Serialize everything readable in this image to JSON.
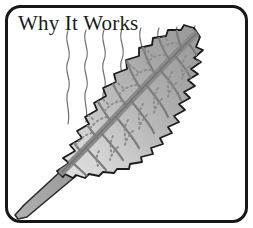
{
  "figure": {
    "title": "Why It Works",
    "width": 253,
    "height": 228,
    "background_color": "#ffffff",
    "frame": {
      "shape": "rounded-rectangle",
      "stroke_color": "#171717",
      "stroke_width": 3,
      "corner_radius": 14,
      "inset": 5
    },
    "illustration": {
      "subject": "leaf-with-transpiration-lines",
      "leaf": {
        "orientation": "diagonal, tip upper-right, stem lower-left",
        "edge": "serrated",
        "outline_color": "#1c1c1c",
        "fill_dark": "#9d9d9d",
        "fill_mid": "#b9b9b9",
        "fill_light": "#dcdcdc",
        "midrib_color": "#8a8a8a",
        "midrib_outline_color": "#6b6b6b",
        "vein_color": "#7d7d7d",
        "dotted_vein_color": "#8c8c8c",
        "stem_fill": "#a3a3a3",
        "stem_outline": "#2a2a2a"
      },
      "transpiration_lines": {
        "count": 8,
        "color": "#6f6f6f",
        "stroke_width": 1.2,
        "description": "thin wavy vertical lines rising above the leaf surface"
      }
    }
  }
}
